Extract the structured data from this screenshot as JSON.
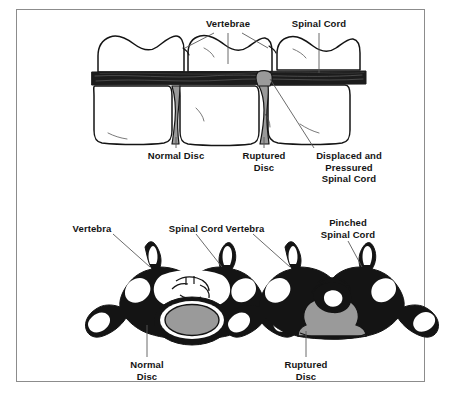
{
  "figure": {
    "title_present": false,
    "border_color": "#8c8c8c",
    "background_color": "#ffffff",
    "ink_color": "#141414",
    "disc_gray": "#9a9a9a",
    "cord_dark": "#1a1a1a"
  },
  "panels": [
    {
      "id": "lateral",
      "name": "lateral-side-view",
      "labels": {
        "vertebrae": "Vertebrae",
        "spinal_cord": "Spinal Cord",
        "normal_disc": "Normal Disc",
        "ruptured_disc": "Ruptured\nDisc",
        "displaced_cord": "Displaced and\nPressured\nSpinal Cord"
      }
    },
    {
      "id": "cross_normal",
      "name": "cross-section-normal",
      "labels": {
        "vertebra": "Vertebra",
        "spinal_cord": "Spinal Cord",
        "disc": "Normal\nDisc"
      }
    },
    {
      "id": "cross_ruptured",
      "name": "cross-section-ruptured",
      "labels": {
        "vertebra": "Vertebra",
        "spinal_cord": "Pinched\nSpinal Cord",
        "disc": "Ruptured\nDisc"
      }
    }
  ]
}
